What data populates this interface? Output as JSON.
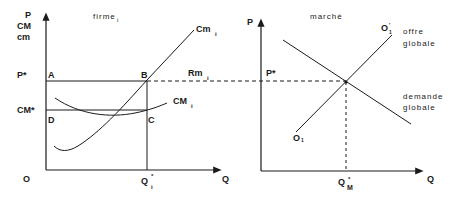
{
  "left_panel": {
    "title": "firme",
    "title_sub": "i",
    "y_axis_labels": [
      "P",
      "CM",
      "cm"
    ],
    "x_axis_label": "Q",
    "origin_label": "O",
    "price_label": "P*",
    "avg_cost_label": "CM*",
    "quantity_label": "Q",
    "quantity_sup": "*",
    "quantity_sub": "i",
    "points": {
      "A": "A",
      "B": "B",
      "C": "C",
      "D": "D"
    },
    "curves": {
      "marginal_cost": {
        "label": "Cm",
        "sub": "i"
      },
      "average_cost": {
        "label": "CM",
        "sub": "i"
      },
      "marginal_revenue": {
        "label": "Rm",
        "sub": "i"
      }
    }
  },
  "right_panel": {
    "title": "marché",
    "y_axis_label": "P",
    "x_axis_label": "Q",
    "price_label": "P*",
    "quantity_label": "Q",
    "quantity_sup": "*",
    "quantity_sub": "M",
    "supply": {
      "start_label": "O",
      "start_sub": "1",
      "end_label": "O",
      "end_sup": "'",
      "end_sub": "1",
      "desc_line1": "offre",
      "desc_line2": "globale"
    },
    "demand": {
      "desc_line1": "demande",
      "desc_line2": "globale"
    }
  },
  "colors": {
    "ink": "#1a1a1a",
    "background": "#ffffff"
  }
}
